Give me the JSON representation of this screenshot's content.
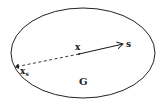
{
  "diagram": {
    "region_label": "G",
    "point_label": "x",
    "direction_label": "s",
    "boundary_point_label": "x",
    "boundary_point_subscript": "s",
    "colors": {
      "stroke": "#222222",
      "background": "#ffffff"
    }
  }
}
